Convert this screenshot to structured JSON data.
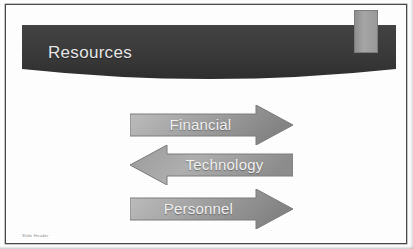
{
  "slide": {
    "title": "Resources",
    "footer": "Slide Header",
    "background_color": "#ffffff",
    "frame_color": "#4a4a4a"
  },
  "banner": {
    "name": "title-banner",
    "fill_color": "#3a3a3a",
    "text_color": "#e8e8e8"
  },
  "accent": {
    "name": "accent-bar",
    "color": "#9a9a9a"
  },
  "arrows": [
    {
      "label": "Financial",
      "direction": "right",
      "fill_start": "#b6b6b6",
      "fill_end": "#8e8e8e",
      "text_color": "#f2f2f2"
    },
    {
      "label": "Technology",
      "direction": "left",
      "fill_start": "#b6b6b6",
      "fill_end": "#8e8e8e",
      "text_color": "#f2f2f2"
    },
    {
      "label": "Personnel",
      "direction": "right",
      "fill_start": "#b6b6b6",
      "fill_end": "#8e8e8e",
      "text_color": "#f2f2f2"
    }
  ]
}
